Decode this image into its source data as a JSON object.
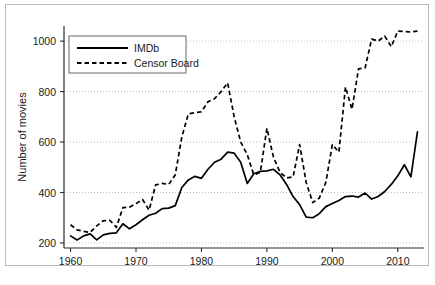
{
  "chart_data": {
    "type": "line",
    "title": "",
    "xlabel": "",
    "ylabel": "Number of movies",
    "xlim": [
      1959,
      2014
    ],
    "ylim": [
      180,
      1060
    ],
    "xticks": [
      1960,
      1970,
      1980,
      1990,
      2000,
      2010
    ],
    "yticks": [
      200,
      400,
      600,
      800,
      1000
    ],
    "grid": "horizontal-dotted",
    "legend_position": "top-left-inside",
    "x": [
      1960,
      1961,
      1962,
      1963,
      1964,
      1965,
      1966,
      1967,
      1968,
      1969,
      1970,
      1971,
      1972,
      1973,
      1974,
      1975,
      1976,
      1977,
      1978,
      1979,
      1980,
      1981,
      1982,
      1983,
      1984,
      1985,
      1986,
      1987,
      1988,
      1989,
      1990,
      1991,
      1992,
      1993,
      1994,
      1995,
      1996,
      1997,
      1998,
      1999,
      2000,
      2001,
      2002,
      2003,
      2004,
      2005,
      2006,
      2007,
      2008,
      2009,
      2010,
      2011,
      2012,
      2013
    ],
    "series": [
      {
        "name": "IMDb",
        "style": "solid",
        "values": [
          228,
          212,
          228,
          236,
          212,
          232,
          238,
          240,
          276,
          256,
          272,
          292,
          310,
          318,
          336,
          338,
          348,
          420,
          450,
          464,
          456,
          492,
          520,
          532,
          560,
          556,
          520,
          436,
          474,
          484,
          486,
          492,
          470,
          432,
          384,
          352,
          302,
          300,
          316,
          344,
          356,
          368,
          384,
          386,
          382,
          398,
          374,
          384,
          404,
          432,
          466,
          510,
          462,
          640
        ]
      },
      {
        "name": "Censor Board",
        "style": "dashed",
        "values": [
          272,
          252,
          246,
          242,
          268,
          288,
          290,
          262,
          340,
          342,
          356,
          372,
          330,
          430,
          436,
          432,
          470,
          620,
          712,
          716,
          720,
          760,
          772,
          800,
          835,
          700,
          600,
          550,
          470,
          480,
          655,
          540,
          480,
          458,
          462,
          590,
          440,
          360,
          378,
          440,
          590,
          560,
          818,
          730,
          890,
          894,
          1008,
          1000,
          1020,
          978,
          1040,
          1038,
          1036,
          1040
        ]
      }
    ]
  },
  "legend": {
    "items": [
      {
        "label": "IMDb",
        "style": "solid"
      },
      {
        "label": "Censor Board",
        "style": "dashed"
      }
    ]
  },
  "axes": {
    "y_title": "Number of movies",
    "y_tick_labels": [
      "1000",
      "800",
      "600",
      "400",
      "200"
    ],
    "x_tick_labels": [
      "1960",
      "1970",
      "1980",
      "1990",
      "2000",
      "2010"
    ]
  },
  "colors": {
    "line": "#000000",
    "grid": "#b0b0b0",
    "axis": "#2a2a2a",
    "frame": "#b9b9b9",
    "background": "#ffffff"
  }
}
